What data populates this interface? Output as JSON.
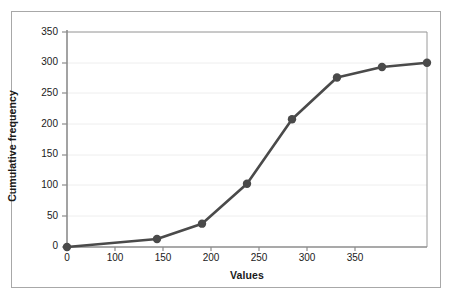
{
  "chart_data": {
    "type": "line",
    "title": "",
    "subtitle": "",
    "xlabel": "Values",
    "ylabel": "Cumulative frequency",
    "x": [
      0,
      100,
      150,
      200,
      250,
      300,
      350,
      400
    ],
    "values": [
      0,
      13,
      38,
      103,
      208,
      276,
      293,
      300
    ],
    "series": [
      {
        "name": "Cumulative frequency",
        "values": [
          0,
          13,
          38,
          103,
          208,
          276,
          293,
          300
        ]
      }
    ],
    "xticks": [
      0,
      100,
      150,
      200,
      250,
      300,
      350
    ],
    "xtick_labels": [
      "0",
      "100",
      "150",
      "200",
      "250",
      "300",
      "350"
    ],
    "yticks": [
      0,
      50,
      100,
      150,
      200,
      250,
      300,
      350
    ],
    "ytick_labels": [
      "0",
      "50",
      "100",
      "150",
      "200",
      "250",
      "300",
      "350"
    ],
    "xlim": [
      0,
      400
    ],
    "ylim": [
      0,
      350
    ],
    "grid": true,
    "grid_axis": "y",
    "legend": false,
    "legend_position": "none",
    "marker": "circle",
    "annotations": []
  },
  "style": {
    "line_color": "#4a4a4a",
    "marker_color": "#4a4a4a",
    "grid_color": "#eeeeee",
    "axis_color": "#8c8c8c",
    "text_color": "#1a1a1a",
    "frame_color": "#a8a8a8",
    "background": "#ffffff"
  }
}
